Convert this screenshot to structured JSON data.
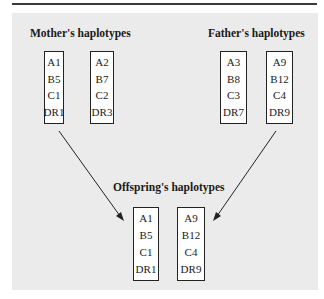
{
  "diagram": {
    "mother": {
      "title": "Mother's haplotypes",
      "haplotypes": [
        [
          "A1",
          "B5",
          "C1",
          "DR1"
        ],
        [
          "A2",
          "B7",
          "C2",
          "DR3"
        ]
      ]
    },
    "father": {
      "title": "Father's haplotypes",
      "haplotypes": [
        [
          "A3",
          "B8",
          "C3",
          "DR7"
        ],
        [
          "A9",
          "B12",
          "C4",
          "DR9"
        ]
      ]
    },
    "offspring": {
      "title": "Offspring's haplotypes",
      "haplotypes": [
        [
          "A1",
          "B5",
          "C1",
          "DR1"
        ],
        [
          "A9",
          "B12",
          "C4",
          "DR9"
        ]
      ]
    },
    "arrows": [
      {
        "from": "mother.haplotypes.0",
        "to": "offspring.haplotypes.0"
      },
      {
        "from": "father.haplotypes.1",
        "to": "offspring.haplotypes.1"
      }
    ],
    "colors": {
      "panel_background": "#ebebeb",
      "box_background": "#ffffff",
      "line": "#222222"
    }
  }
}
